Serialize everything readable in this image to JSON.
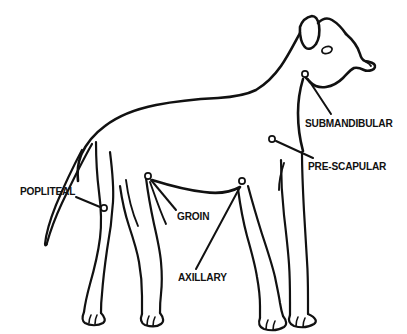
{
  "diagram": {
    "view": "side-profile standing",
    "line_color": "#111111",
    "background_color": "#ffffff",
    "marker_fill": "#ffffff"
  },
  "labels": [
    {
      "id": "popliteal",
      "text": "POPLITEAL",
      "marker_x": 104,
      "marker_y": 208,
      "leader_from_x": 76,
      "leader_from_y": 197,
      "leader_to_x": 100,
      "leader_to_y": 207
    },
    {
      "id": "groin",
      "text": "GROIN",
      "marker_x": 148,
      "marker_y": 176,
      "leader_from_x": 176,
      "leader_from_y": 210,
      "leader_to_x": 151,
      "leader_to_y": 180
    },
    {
      "id": "axillary",
      "text": "AXILLARY",
      "marker_x": 242,
      "marker_y": 181,
      "leader_from_x": 196,
      "leader_from_y": 269,
      "leader_to_x": 240,
      "leader_to_y": 187
    },
    {
      "id": "submandibular",
      "text": "SUBMANDIBULAR",
      "marker_x": 305,
      "marker_y": 74,
      "leader_from_x": 331,
      "leader_from_y": 114,
      "leader_to_x": 308,
      "leader_to_y": 79
    },
    {
      "id": "pre-scapular",
      "text": "PRE-SCAPULAR",
      "marker_x": 272,
      "marker_y": 139,
      "leader_from_x": 313,
      "leader_from_y": 158,
      "leader_to_x": 276,
      "leader_to_y": 141
    }
  ],
  "icons": {
    "node_marker": "lymph-node-marker-circle",
    "eye": "dog-eye"
  }
}
